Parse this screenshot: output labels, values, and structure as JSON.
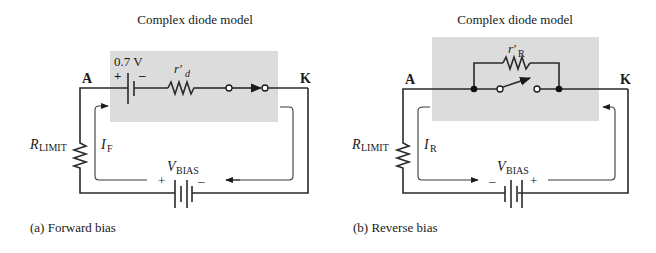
{
  "figure": {
    "panels": [
      {
        "id": "a",
        "title": "Complex diode model",
        "caption": "(a) Forward bias",
        "node_anode": "A",
        "node_cathode": "K",
        "barrier_voltage": "0.7 V",
        "barrier_plus": "+",
        "barrier_minus": "–",
        "resistor_label_main": "r′",
        "resistor_label_sub": "d",
        "rlimit_main": "R",
        "rlimit_sub": "LIMIT",
        "current_main": "I",
        "current_sub": "F",
        "vbias_main": "V",
        "vbias_sub": "BIAS",
        "vbias_left_sign": "+",
        "vbias_right_sign": "–",
        "switch_state": "closed"
      },
      {
        "id": "b",
        "title": "Complex diode model",
        "caption": "(b) Reverse bias",
        "node_anode": "A",
        "node_cathode": "K",
        "resistor_label_main": "r′",
        "resistor_label_sub": "R",
        "rlimit_main": "R",
        "rlimit_sub": "LIMIT",
        "current_main": "I",
        "current_sub": "R",
        "vbias_main": "V",
        "vbias_sub": "BIAS",
        "vbias_left_sign": "–",
        "vbias_right_sign": "+",
        "switch_state": "open"
      }
    ],
    "colors": {
      "shade": "#dcdcdc",
      "ink": "#1a1a1a"
    }
  }
}
